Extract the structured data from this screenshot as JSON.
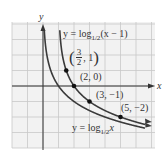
{
  "chart_data": {
    "type": "line",
    "title": "",
    "xlabel": "x",
    "ylabel": "y",
    "grid": true,
    "xlim": [
      -2,
      7
    ],
    "ylim": [
      -4,
      4
    ],
    "series": [
      {
        "name": "y = log_{1/2}(x - 1)",
        "function": "log_{1/2}(x-1)",
        "asymptote_x": 1
      },
      {
        "name": "y = log_{1/2}x",
        "function": "log_{1/2}(x)",
        "asymptote_x": 0
      }
    ],
    "points": [
      {
        "label": "(3/2, 1)",
        "x": 1.5,
        "y": 1
      },
      {
        "label": "(2, 0)",
        "x": 2,
        "y": 0
      },
      {
        "label": "(3, -1)",
        "x": 3,
        "y": -1
      },
      {
        "label": "(5, -2)",
        "x": 5,
        "y": -2
      }
    ]
  },
  "labels": {
    "x_axis": "x",
    "y_axis": "y",
    "curve1_prefix": "y = log",
    "curve1_sub": "1/2",
    "curve1_suffix": "(x − 1)",
    "curve2_prefix": "y = log",
    "curve2_sub": "1/2",
    "curve2_suffix": "x",
    "p1_num": "3",
    "p1_den": "2",
    "p1_rest": ", 1",
    "p2": "(2, 0)",
    "p3": "(3, −1)",
    "p4": "(5, −2)"
  },
  "colors": {
    "grid": "#c8c8c8",
    "curve": "#3a3a3a",
    "axis": "#333333",
    "bg": "#eeeeee"
  }
}
